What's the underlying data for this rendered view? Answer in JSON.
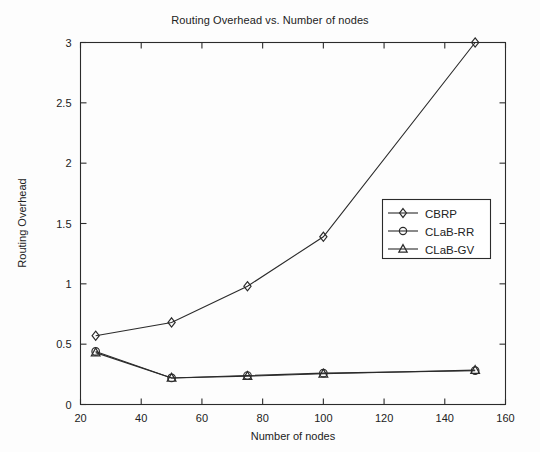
{
  "chart_data": {
    "type": "line",
    "title": "Routing Overhead vs. Number of nodes",
    "xlabel": "Number of nodes",
    "ylabel": "Routing Overhead",
    "xlim": [
      20,
      160
    ],
    "ylim": [
      0,
      3
    ],
    "xticks": [
      20,
      40,
      60,
      80,
      100,
      120,
      140,
      160
    ],
    "yticks": [
      0,
      0.5,
      1,
      1.5,
      2,
      2.5,
      3
    ],
    "xticklabels": [
      "20",
      "40",
      "60",
      "80",
      "100",
      "120",
      "140",
      "160"
    ],
    "yticklabels": [
      "0",
      "0.5",
      "1",
      "1.5",
      "2",
      "2.5",
      "3"
    ],
    "grid": false,
    "legend_position": "center-right",
    "x": [
      25,
      50,
      75,
      100,
      150
    ],
    "series": [
      {
        "name": "CBRP",
        "marker": "diamond",
        "values": [
          0.57,
          0.68,
          0.98,
          1.39,
          3.0
        ]
      },
      {
        "name": "CLaB-RR",
        "marker": "circle",
        "values": [
          0.44,
          0.22,
          0.24,
          0.26,
          0.28
        ]
      },
      {
        "name": "CLaB-GV",
        "marker": "triangle",
        "values": [
          0.43,
          0.22,
          0.235,
          0.255,
          0.285
        ]
      }
    ]
  },
  "legend": {
    "entries": [
      {
        "label": "CBRP",
        "marker": "diamond"
      },
      {
        "label": "CLaB-RR",
        "marker": "circle"
      },
      {
        "label": "CLaB-GV",
        "marker": "triangle"
      }
    ]
  }
}
